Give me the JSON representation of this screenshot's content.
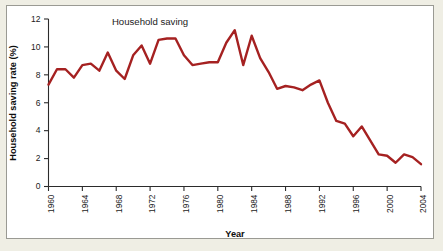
{
  "figure": {
    "background_color": "#efeee4",
    "panel_color": "#ffffff",
    "border_color": "#9a9a93"
  },
  "chart_data": {
    "type": "line",
    "title": "",
    "subtitle": "",
    "xlabel": "Year",
    "ylabel": "Household saving rate (%)",
    "xlim": [
      1960,
      2004
    ],
    "ylim": [
      0,
      12
    ],
    "xticks": [
      1960,
      1964,
      1968,
      1972,
      1976,
      1980,
      1984,
      1988,
      1992,
      1996,
      2000,
      2004
    ],
    "xtick_labels": [
      "1960",
      "1964",
      "1968",
      "1972",
      "1976",
      "1980",
      "1984",
      "1988",
      "1992",
      "1996",
      "2000",
      "2004"
    ],
    "xtick_rotation": 90,
    "yticks": [
      0,
      2,
      4,
      6,
      8,
      10,
      12
    ],
    "ytick_labels": [
      "0",
      "2",
      "4",
      "6",
      "8",
      "10",
      "12"
    ],
    "grid": false,
    "legend": false,
    "legend_position": "none",
    "line_color": "#a52121",
    "line_width": 2.4,
    "annotations": [
      {
        "text": "Household saving",
        "x": 1972.0,
        "y": 11.55
      }
    ],
    "series": [
      {
        "name": "Household saving",
        "color": "#a52121",
        "x": [
          1960,
          1961,
          1962,
          1963,
          1964,
          1965,
          1966,
          1967,
          1968,
          1969,
          1970,
          1971,
          1972,
          1973,
          1974,
          1975,
          1976,
          1977,
          1978,
          1979,
          1980,
          1981,
          1982,
          1983,
          1984,
          1985,
          1986,
          1987,
          1988,
          1989,
          1990,
          1991,
          1992,
          1993,
          1994,
          1995,
          1996,
          1997,
          1998,
          1999,
          2000,
          2001,
          2002,
          2003,
          2004
        ],
        "values": [
          7.3,
          8.4,
          8.4,
          7.8,
          8.7,
          8.8,
          8.3,
          9.6,
          8.3,
          7.7,
          9.4,
          10.1,
          8.8,
          10.5,
          10.6,
          10.6,
          9.4,
          8.7,
          8.8,
          8.9,
          8.9,
          10.3,
          11.2,
          8.7,
          10.8,
          9.2,
          8.2,
          7.0,
          7.2,
          7.1,
          6.9,
          7.3,
          7.6,
          6.0,
          4.7,
          4.5,
          3.6,
          4.3,
          3.3,
          2.3,
          2.2,
          1.7,
          2.3,
          2.1,
          1.6
        ]
      }
    ]
  }
}
